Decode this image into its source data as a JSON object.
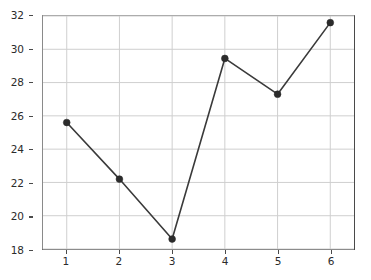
{
  "chart_data": {
    "type": "line",
    "title": "",
    "xlabel": "",
    "ylabel": "",
    "x": [
      1,
      2,
      3,
      4,
      5,
      6
    ],
    "values": [
      25.6,
      22.2,
      18.6,
      29.45,
      27.3,
      31.6
    ],
    "xlim": [
      0.55,
      6.45
    ],
    "ylim": [
      18,
      32
    ],
    "xticks": [
      1,
      2,
      3,
      4,
      5,
      6
    ],
    "yticks": [
      18,
      20,
      22,
      24,
      26,
      28,
      30,
      32
    ],
    "xtick_labels": [
      "1",
      "2",
      "3",
      "4",
      "5",
      "6"
    ],
    "ytick_labels": [
      "18",
      "20",
      "22",
      "24",
      "26",
      "28",
      "30",
      "32"
    ],
    "grid": true,
    "legend": null,
    "marker": "circle",
    "line_color": "#3a3a3a",
    "marker_color": "#2b2b2b",
    "grid_color": "#cfcfcf",
    "axes_color": "#4a4a4a",
    "background_color": "#ffffff"
  }
}
